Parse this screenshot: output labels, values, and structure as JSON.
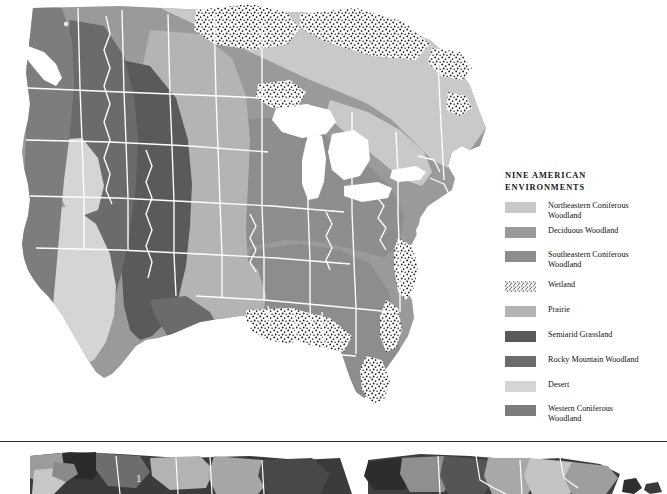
{
  "legend": {
    "title_line1": "NINE AMERICAN",
    "title_line2": "ENVIRONMENTS",
    "items": [
      {
        "label_line1": "Northeastern Coniferous",
        "label_line2": "Woodland",
        "color": "#c9c9c9",
        "pattern": "solid"
      },
      {
        "label_line1": "Deciduous Woodland",
        "label_line2": "",
        "color": "#9a9a9a",
        "pattern": "solid"
      },
      {
        "label_line1": "Southeastern Coniferous",
        "label_line2": "Woodland",
        "color": "#8d8d8d",
        "pattern": "solid"
      },
      {
        "label_line1": "Wetland",
        "label_line2": "",
        "color": "#3a3a3a",
        "pattern": "stipple"
      },
      {
        "label_line1": "Prairie",
        "label_line2": "",
        "color": "#b4b4b4",
        "pattern": "solid"
      },
      {
        "label_line1": "Semiarid Grassland",
        "label_line2": "",
        "color": "#5a5a5a",
        "pattern": "solid"
      },
      {
        "label_line1": "Rocky Mountain Woodland",
        "label_line2": "",
        "color": "#6b6b6b",
        "pattern": "solid"
      },
      {
        "label_line1": "Desert",
        "label_line2": "",
        "color": "#d5d5d5",
        "pattern": "solid"
      },
      {
        "label_line1": "Western Coniferous",
        "label_line2": "Woodland",
        "color": "#7d7d7d",
        "pattern": "solid"
      }
    ]
  },
  "map": {
    "name": "nine-american-environments-map",
    "water_color": "#ffffff",
    "border_color": "#ffffff",
    "background_color": "#ffffff"
  },
  "lower_map": {
    "number_label": "1"
  }
}
